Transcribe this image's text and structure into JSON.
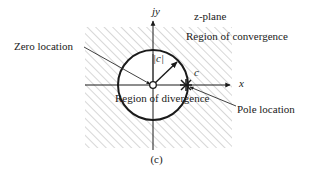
{
  "figure": {
    "caption": "(c)",
    "plane_label": "z-plane",
    "axes": {
      "y_label": "jy",
      "x_label": "x"
    },
    "annotations": {
      "zero_location": "Zero location",
      "pole_location": "Pole location",
      "region_of_convergence": "Region of convergence",
      "region_of_divergence": "Region of divergence",
      "radius_label": "|c|",
      "pole_point_label": "c"
    },
    "colors": {
      "ink": "#1a1a1a",
      "hatch": "#b9b9b9",
      "thin_line": "#555555"
    },
    "geometry": {
      "origin_x": 153,
      "origin_y": 85,
      "circle_radius": 35,
      "hatch_left": 85,
      "hatch_top": 27,
      "hatch_right": 232,
      "hatch_bottom": 148,
      "pole_x": 186,
      "pole_y": 85
    }
  }
}
